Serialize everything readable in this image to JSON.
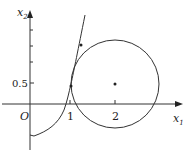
{
  "diagram": {
    "axes": {
      "x_label": "x",
      "x_label_sub": "1",
      "y_label": "x",
      "y_label_sub": "2",
      "origin_label": "O"
    },
    "ticks": {
      "x": [
        "1",
        "2"
      ],
      "y": [
        "0.5"
      ]
    },
    "circle": {
      "center": [
        2,
        0.5
      ],
      "radius_units": 0.96
    },
    "curve": "curve from (0,-1.5) rising through (1,0.5) and upward",
    "marked_points": [
      {
        "label": "center",
        "x": 2,
        "y": 0.5
      },
      {
        "label": "intersection-1",
        "x": 1,
        "y": 0.5
      },
      {
        "label": "intersection-2",
        "x": 1.3,
        "y": 1.7
      }
    ],
    "colors": {
      "stroke": "#333333",
      "background": "#ffffff"
    }
  }
}
